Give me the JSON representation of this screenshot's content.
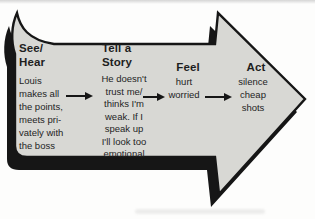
{
  "diagram": {
    "title_implied": "",
    "columns": [
      {
        "heading": "See/\nHear",
        "body": "Louis\nmakes all\nthe points,\nmeets pri-\nvately with\nthe boss"
      },
      {
        "heading": "Tell a\nStory",
        "body": "He doesn't\ntrust me/\nthinks I'm\nweak. If I\nspeak up\nI'll look too\nemotional"
      },
      {
        "heading": "Feel",
        "body": "hurt\nworried"
      },
      {
        "heading": "Act",
        "body": "silence\ncheap\nshots"
      }
    ],
    "icons": {
      "big_arrow": "right-arrow-shape",
      "connector": "flow-arrow-right"
    },
    "colors": {
      "arrow_fill": "#d8d8d4",
      "arrow_outline": "#161616",
      "arrow_shadow": "#161616",
      "text": "#1e1e1e",
      "background": "#fdfdfc"
    }
  }
}
